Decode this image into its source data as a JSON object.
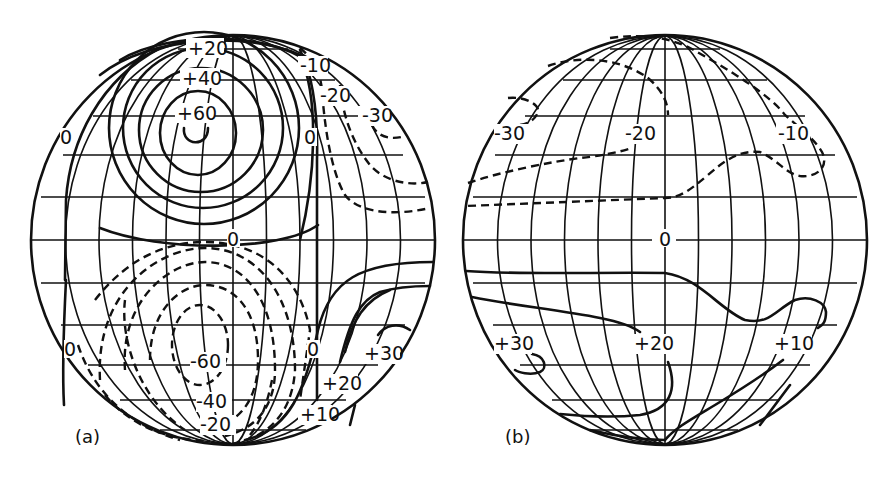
{
  "figure": {
    "panels": [
      {
        "id": "a",
        "caption": "(a)",
        "center": [
          233,
          240
        ],
        "radius": 204,
        "labels": {
          "pos20": "+20",
          "pos40": "+40",
          "pos60": "+60",
          "neg10": "-10",
          "neg20": "-20",
          "neg30": "-30",
          "zero_tl": "0",
          "zero_tr": "0",
          "zero_mid": "0",
          "zero_bl": "0",
          "zero_br": "0",
          "neg60_low": "-60",
          "neg40_low": "-40",
          "neg20_low": "-20",
          "pos30_low": "+30",
          "pos20_low": "+20",
          "pos10_low": "+10"
        }
      },
      {
        "id": "b",
        "caption": "(b)",
        "center": [
          665,
          240
        ],
        "radius": 204,
        "labels": {
          "neg30": "-30",
          "neg20": "-20",
          "neg10": "-10",
          "zero": "0",
          "pos30": "+30",
          "pos20": "+20",
          "pos10": "+10"
        }
      }
    ],
    "colors": {
      "ink": "#111111",
      "paper": "#ffffff"
    },
    "legend_semantics": {
      "solid": "positive / zero contour",
      "dashed": "negative contour"
    }
  }
}
